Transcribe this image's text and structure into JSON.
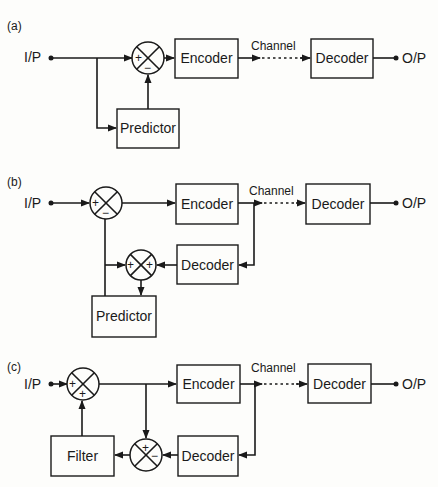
{
  "diagrams": {
    "a": {
      "label": "(a)",
      "input": "I/P",
      "output": "O/P",
      "channel": "Channel",
      "encoder": "Encoder",
      "decoder": "Decoder",
      "predictor": "Predictor",
      "sum_signs": [
        "+",
        "−"
      ]
    },
    "b": {
      "label": "(b)",
      "input": "I/P",
      "output": "O/P",
      "channel": "Channel",
      "encoder": "Encoder",
      "decoder": "Decoder",
      "local_decoder": "Decoder",
      "predictor": "Predictor",
      "sub_signs": [
        "+",
        "−"
      ],
      "add_signs": [
        "+",
        "+"
      ]
    },
    "c": {
      "label": "(c)",
      "input": "I/P",
      "output": "O/P",
      "channel": "Channel",
      "encoder": "Encoder",
      "decoder": "Decoder",
      "local_decoder": "Decoder",
      "filter": "Filter",
      "add_signs": [
        "+",
        "+"
      ],
      "sub_signs": [
        "+",
        "−"
      ]
    }
  }
}
